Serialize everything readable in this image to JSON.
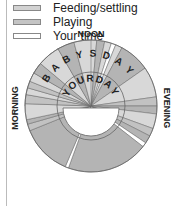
{
  "legend": [
    {
      "label": "Feeding/settling",
      "color": "#d2d2d2"
    },
    {
      "label": "Playing",
      "color": "#c4c4c4"
    },
    {
      "label": "Your time",
      "color": "#ffffff"
    }
  ],
  "labels": {
    "top": "NOON",
    "left": "MORNING",
    "right": "EVENING"
  },
  "outer_ring_text": [
    "B",
    "A",
    "B",
    "Y",
    "S",
    "D",
    "A",
    "Y"
  ],
  "inner_ring_text": [
    "Y",
    "O",
    "U",
    "R",
    "D",
    "A",
    "Y"
  ],
  "colors": {
    "sleep": "#b4b4b4",
    "feed": "#d8d8d8",
    "play": "#c2c2c2",
    "your": "#ffffff",
    "line": "#666666"
  },
  "segments": [
    {
      "from": -90,
      "to": -75,
      "type": "play"
    },
    {
      "from": -75,
      "to": -60,
      "type": "feed"
    },
    {
      "from": -60,
      "to": -52,
      "type": "sleep"
    },
    {
      "from": -52,
      "to": -45,
      "type": "feed"
    },
    {
      "from": -45,
      "to": -30,
      "type": "play"
    },
    {
      "from": -30,
      "to": -8,
      "type": "feed"
    },
    {
      "from": -8,
      "to": -2,
      "type": "sleep"
    },
    {
      "from": -2,
      "to": 5,
      "type": "feed"
    },
    {
      "from": 5,
      "to": 12,
      "type": "sleep"
    },
    {
      "from": 12,
      "to": 18,
      "type": "feed"
    },
    {
      "from": 18,
      "to": 22,
      "type": "your"
    },
    {
      "from": 22,
      "to": 28,
      "type": "feed"
    },
    {
      "from": 28,
      "to": 55,
      "type": "sleep"
    },
    {
      "from": 55,
      "to": 82,
      "type": "feed"
    },
    {
      "from": 82,
      "to": 90,
      "type": "play"
    },
    {
      "from": 90,
      "to": 97,
      "type": "sleep"
    },
    {
      "from": 97,
      "to": 110,
      "type": "feed"
    },
    {
      "from": 110,
      "to": 117,
      "type": "play"
    },
    {
      "from": 117,
      "to": 124,
      "type": "sleep"
    },
    {
      "from": 124,
      "to": 128,
      "type": "your"
    },
    {
      "from": 128,
      "to": 200,
      "type": "sleep"
    },
    {
      "from": 200,
      "to": 203,
      "type": "your"
    },
    {
      "from": 203,
      "to": 248,
      "type": "sleep"
    },
    {
      "from": 248,
      "to": 254,
      "type": "play"
    },
    {
      "from": 254,
      "to": 258,
      "type": "sleep"
    },
    {
      "from": 258,
      "to": 272,
      "type": "feed"
    },
    {
      "from": 272,
      "to": 280,
      "type": "play"
    },
    {
      "from": 280,
      "to": 286,
      "type": "feed"
    },
    {
      "from": 286,
      "to": 292,
      "type": "play"
    },
    {
      "from": 292,
      "to": 300,
      "type": "feed"
    },
    {
      "from": 300,
      "to": 310,
      "type": "sleep"
    },
    {
      "from": 310,
      "to": 330,
      "type": "feed"
    },
    {
      "from": 330,
      "to": 345,
      "type": "sleep"
    },
    {
      "from": 345,
      "to": 360,
      "type": "feed"
    }
  ]
}
